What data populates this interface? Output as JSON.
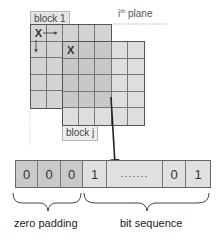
{
  "diagram": {
    "plane_label": {
      "prefix": "i",
      "sup": "th",
      "suffix": " plane"
    },
    "block_first": {
      "label": "block 1",
      "marker": "X",
      "rows": 5,
      "cols": 5,
      "fill": "#d4d4d4"
    },
    "block_other": {
      "label": "block j",
      "marker": "X",
      "rows": 5,
      "cols": 5,
      "fill_overlap": "#c8c8c8",
      "fill_plain": "#dedede"
    },
    "bit_strip": {
      "cells": [
        {
          "value": "0",
          "group": "zero padding",
          "fill": "#c9c9c9"
        },
        {
          "value": "0",
          "group": "zero padding",
          "fill": "#c9c9c9"
        },
        {
          "value": "0",
          "group": "zero padding",
          "fill": "#c9c9c9"
        },
        {
          "value": "1",
          "group": "bit sequence",
          "fill": "#e0e0e0"
        },
        {
          "value": "·······",
          "group": "bit sequence",
          "fill": "#e0e0e0"
        },
        {
          "value": "0",
          "group": "bit sequence",
          "fill": "#e0e0e0"
        },
        {
          "value": "1",
          "group": "bit sequence",
          "fill": "#e0e0e0"
        }
      ]
    },
    "braces": [
      {
        "label": "zero padding"
      },
      {
        "label": "bit sequence"
      }
    ]
  }
}
